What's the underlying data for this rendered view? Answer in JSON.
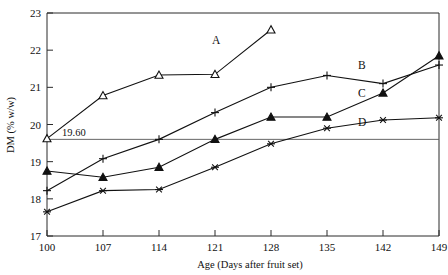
{
  "chart_data": {
    "type": "line",
    "title": "",
    "xlabel": "Age (Days after fruit set)",
    "ylabel": "DM (% w/w)",
    "x": [
      100,
      107,
      114,
      121,
      128,
      135,
      142,
      149
    ],
    "xlim": [
      100,
      149
    ],
    "ylim": [
      17,
      23
    ],
    "yticks": [
      17,
      18,
      19,
      20,
      21,
      22,
      23
    ],
    "xticks": [
      100,
      107,
      114,
      121,
      128,
      135,
      142,
      149
    ],
    "grid": false,
    "legend_position": "inline-right-of-series",
    "annotations": [
      {
        "text": "19.60",
        "value": 19.6,
        "type": "horizontal-reference-line"
      }
    ],
    "series": [
      {
        "name": "A",
        "marker": "open-triangle",
        "x": [
          100,
          107,
          114,
          121,
          128
        ],
        "values": [
          19.62,
          20.78,
          21.33,
          21.35,
          22.55
        ]
      },
      {
        "name": "B",
        "marker": "plus",
        "x": [
          100,
          107,
          114,
          121,
          128,
          135,
          142,
          149
        ],
        "values": [
          18.22,
          19.08,
          19.6,
          20.32,
          21.0,
          21.32,
          21.1,
          21.6
        ]
      },
      {
        "name": "C",
        "marker": "filled-triangle",
        "x": [
          100,
          107,
          114,
          121,
          128,
          135,
          142,
          149
        ],
        "values": [
          18.75,
          18.58,
          18.85,
          19.6,
          20.2,
          20.2,
          20.85,
          21.85
        ]
      },
      {
        "name": "D",
        "marker": "asterisk",
        "x": [
          100,
          107,
          114,
          121,
          128,
          135,
          142,
          149
        ],
        "values": [
          17.65,
          18.22,
          18.25,
          18.85,
          19.48,
          19.9,
          20.12,
          20.18
        ]
      }
    ]
  },
  "axis": {
    "y_tick_labels": [
      "23",
      "22",
      "21",
      "20",
      "19",
      "18",
      "17"
    ],
    "x_tick_labels": [
      "100",
      "107",
      "114",
      "121",
      "128",
      "135",
      "142",
      "149"
    ],
    "y_title": "DM (% w/w)",
    "x_title": "Age (Days after fruit set)"
  },
  "series_labels": {
    "a": "A",
    "b": "B",
    "c": "C",
    "d": "D"
  },
  "reference": {
    "label": "19.60"
  }
}
